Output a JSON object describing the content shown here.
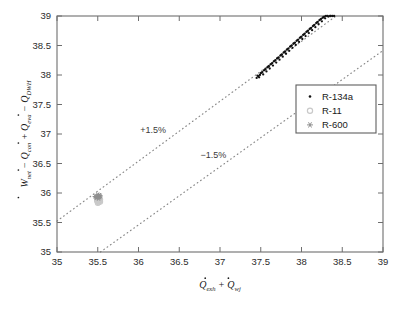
{
  "chart_data": {
    "type": "scatter",
    "title": "",
    "xlabel": "Q̇_exh + Q̇_wj",
    "ylabel": "Ẇ_net − Q̇_con + Q̇_eva − Q̇_DWH",
    "xlim": [
      35,
      39
    ],
    "ylim": [
      35,
      39
    ],
    "xticks": [
      "35",
      "35.5",
      "36",
      "36.5",
      "37",
      "37.5",
      "38",
      "38.5",
      "39"
    ],
    "yticks": [
      "35",
      "35.5",
      "36",
      "36.5",
      "37",
      "37.5",
      "38",
      "38.5",
      "39"
    ],
    "xtick_values": [
      35,
      35.5,
      36,
      36.5,
      37,
      37.5,
      38,
      38.5,
      39
    ],
    "ytick_values": [
      35,
      35.5,
      36,
      36.5,
      37,
      37.5,
      38,
      38.5,
      39
    ],
    "grid": false,
    "legend_position": "upper right",
    "series": [
      {
        "name": "R-134a",
        "marker": "dot",
        "color": "#111111",
        "points": [
          [
            37.45,
            37.95
          ],
          [
            37.47,
            37.98
          ],
          [
            37.49,
            38.0
          ],
          [
            37.5,
            38.03
          ],
          [
            37.52,
            38.05
          ],
          [
            37.54,
            38.08
          ],
          [
            37.56,
            38.1
          ],
          [
            37.58,
            38.13
          ],
          [
            37.6,
            38.15
          ],
          [
            37.62,
            38.18
          ],
          [
            37.64,
            38.2
          ],
          [
            37.66,
            38.23
          ],
          [
            37.68,
            38.25
          ],
          [
            37.7,
            38.28
          ],
          [
            37.72,
            38.3
          ],
          [
            37.74,
            38.33
          ],
          [
            37.76,
            38.35
          ],
          [
            37.78,
            38.38
          ],
          [
            37.8,
            38.4
          ],
          [
            37.82,
            38.43
          ],
          [
            37.84,
            38.45
          ],
          [
            37.86,
            38.48
          ],
          [
            37.88,
            38.5
          ],
          [
            37.9,
            38.53
          ],
          [
            37.92,
            38.55
          ],
          [
            37.94,
            38.58
          ],
          [
            37.96,
            38.6
          ],
          [
            37.98,
            38.63
          ],
          [
            38.0,
            38.65
          ],
          [
            38.02,
            38.68
          ],
          [
            38.04,
            38.7
          ],
          [
            38.06,
            38.73
          ],
          [
            38.08,
            38.75
          ],
          [
            38.1,
            38.78
          ],
          [
            38.12,
            38.8
          ],
          [
            38.14,
            38.83
          ],
          [
            38.16,
            38.85
          ],
          [
            38.18,
            38.88
          ],
          [
            38.2,
            38.9
          ],
          [
            38.22,
            38.93
          ],
          [
            38.24,
            38.95
          ],
          [
            38.26,
            38.97
          ],
          [
            38.28,
            38.99
          ],
          [
            38.3,
            39.0
          ],
          [
            37.46,
            37.99
          ],
          [
            37.51,
            38.04
          ],
          [
            37.55,
            38.09
          ],
          [
            37.59,
            38.14
          ],
          [
            37.63,
            38.19
          ],
          [
            37.67,
            38.24
          ],
          [
            37.71,
            38.29
          ],
          [
            37.75,
            38.34
          ],
          [
            37.79,
            38.39
          ],
          [
            37.83,
            38.44
          ],
          [
            37.87,
            38.49
          ],
          [
            37.91,
            38.54
          ],
          [
            37.95,
            38.59
          ],
          [
            37.99,
            38.64
          ],
          [
            38.03,
            38.69
          ],
          [
            38.07,
            38.74
          ],
          [
            38.11,
            38.79
          ],
          [
            38.15,
            38.84
          ],
          [
            38.19,
            38.89
          ],
          [
            38.23,
            38.94
          ],
          [
            38.27,
            38.98
          ],
          [
            38.32,
            39.0
          ],
          [
            38.35,
            39.0
          ],
          [
            38.38,
            39.0
          ],
          [
            37.48,
            37.96
          ],
          [
            37.53,
            38.01
          ],
          [
            37.57,
            38.06
          ],
          [
            37.61,
            38.11
          ],
          [
            37.65,
            38.16
          ],
          [
            37.69,
            38.21
          ],
          [
            37.73,
            38.26
          ],
          [
            37.77,
            38.31
          ],
          [
            37.81,
            38.36
          ],
          [
            37.85,
            38.41
          ],
          [
            37.89,
            38.46
          ],
          [
            37.93,
            38.51
          ],
          [
            37.97,
            38.56
          ],
          [
            38.01,
            38.61
          ],
          [
            38.05,
            38.66
          ],
          [
            38.09,
            38.71
          ],
          [
            38.13,
            38.76
          ],
          [
            38.17,
            38.81
          ],
          [
            38.21,
            38.86
          ],
          [
            38.25,
            38.91
          ],
          [
            38.29,
            38.96
          ],
          [
            38.33,
            38.99
          ],
          [
            38.36,
            39.0
          ],
          [
            38.4,
            39.0
          ]
        ]
      },
      {
        "name": "R-11",
        "marker": "circle",
        "color": "#c9c9c9",
        "points": [
          [
            35.5,
            35.86
          ],
          [
            35.51,
            35.88
          ],
          [
            35.52,
            35.87
          ],
          [
            35.5,
            35.9
          ],
          [
            35.53,
            35.89
          ],
          [
            35.51,
            35.84
          ],
          [
            35.49,
            35.87
          ],
          [
            35.52,
            35.91
          ],
          [
            35.5,
            35.83
          ],
          [
            35.53,
            35.85
          ]
        ]
      },
      {
        "name": "R-600",
        "marker": "star",
        "color": "#8f8f8f",
        "points": [
          [
            35.49,
            35.93
          ],
          [
            35.5,
            35.95
          ],
          [
            35.51,
            35.94
          ],
          [
            35.52,
            35.96
          ],
          [
            35.48,
            35.92
          ],
          [
            35.5,
            35.97
          ],
          [
            35.52,
            35.93
          ],
          [
            35.47,
            35.94
          ],
          [
            35.53,
            35.95
          ],
          [
            35.51,
            35.91
          ]
        ]
      }
    ],
    "annotations": [
      {
        "text": "+1.5%",
        "x": 36.18,
        "y": 37.02
      },
      {
        "text": "−1.5%",
        "x": 36.92,
        "y": 36.6
      }
    ],
    "reference_lines": [
      {
        "name": "+1.5%",
        "slope": 1.015,
        "style": "dotted"
      },
      {
        "name": "−1.5%",
        "slope": 0.985,
        "style": "dotted"
      }
    ]
  },
  "legend": {
    "entries": [
      {
        "label": "R-134a"
      },
      {
        "label": "R-11"
      },
      {
        "label": "R-600"
      }
    ]
  },
  "axis_labels": {
    "x": {
      "q1": "Q",
      "q1_sub": "exh",
      "plus": "+",
      "q2": "Q",
      "q2_sub": "wj"
    },
    "y": {
      "w": "W",
      "w_sub": "net",
      "minus1": "−",
      "q1": "Q",
      "q1_sub": "con",
      "plus": "+",
      "q2": "Q",
      "q2_sub": "eva",
      "minus2": "−",
      "q3": "Q",
      "q3_sub": "DWH"
    }
  },
  "caption": {
    "text": ""
  },
  "colors": {
    "frame": "#6e6e6e",
    "parity_line": "#8a8a8a",
    "r134a": "#111111",
    "r11": "#c9c9c9",
    "r600": "#8f8f8f",
    "background": "#ffffff"
  }
}
